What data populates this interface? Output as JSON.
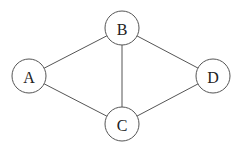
{
  "graph": {
    "type": "undirected",
    "nodes": [
      {
        "id": "A",
        "label": "A",
        "x": 29,
        "y": 76,
        "r": 17
      },
      {
        "id": "B",
        "label": "B",
        "x": 122,
        "y": 28,
        "r": 17
      },
      {
        "id": "C",
        "label": "C",
        "x": 122,
        "y": 124,
        "r": 17
      },
      {
        "id": "D",
        "label": "D",
        "x": 213,
        "y": 76,
        "r": 17
      }
    ],
    "edges": [
      {
        "from": "A",
        "to": "B"
      },
      {
        "from": "A",
        "to": "C"
      },
      {
        "from": "B",
        "to": "C"
      },
      {
        "from": "B",
        "to": "D"
      },
      {
        "from": "C",
        "to": "D"
      }
    ]
  },
  "colors": {
    "stroke": "#555555",
    "text": "#222222",
    "background": "#ffffff"
  }
}
